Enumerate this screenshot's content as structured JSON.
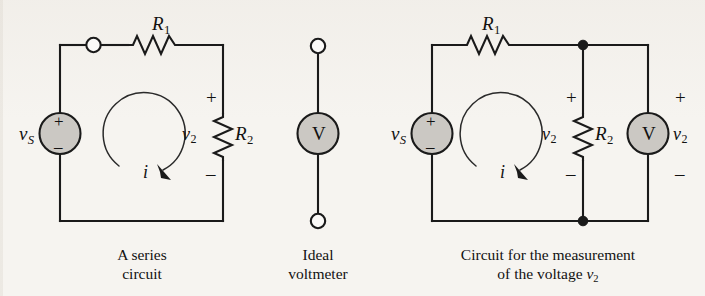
{
  "figure": {
    "kind": "circuit-diagram",
    "background_color": "#f6f4f0",
    "ink_color": "#1a1a1a",
    "component_fill_color": "#cbc8c3",
    "ghost_text_top": "",
    "ghost_text_bottom": ""
  },
  "panel1": {
    "name": "A series circuit",
    "caption_line1": "A series",
    "caption_line2": "circuit",
    "source_label": "v",
    "source_sub": "S",
    "source_plus": "+",
    "source_minus": "–",
    "r1_label": "R",
    "r1_sub": "1",
    "r2_label": "R",
    "r2_sub": "2",
    "v2_label": "v",
    "v2_sub": "2",
    "v2_plus": "+",
    "v2_minus": "–",
    "current_label": "i"
  },
  "panel2": {
    "name": "Ideal voltmeter",
    "caption_line1": "Ideal",
    "caption_line2": "voltmeter",
    "meter_letter": "V"
  },
  "panel3": {
    "name": "Circuit for the measurement of the voltage v2",
    "caption_line1": "Circuit for the measurement",
    "caption_line2_prefix": "of the voltage ",
    "caption_line2_var": "v",
    "caption_line2_sub": "2",
    "source_label": "v",
    "source_sub": "S",
    "source_plus": "+",
    "source_minus": "–",
    "r1_label": "R",
    "r1_sub": "1",
    "r2_label": "R",
    "r2_sub": "2",
    "v2_label": "v",
    "v2_sub": "2",
    "v2_plus": "+",
    "v2_minus": "–",
    "meter_letter": "V",
    "meter_v2_label": "v",
    "meter_v2_sub": "2",
    "meter_plus": "+",
    "meter_minus": "–",
    "current_label": "i"
  }
}
